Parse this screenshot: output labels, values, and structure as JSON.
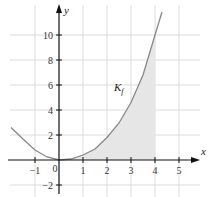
{
  "figure": {
    "x_axis_label": "x",
    "y_axis_label": "y",
    "curve_label": "K",
    "curve_label_sub": "f",
    "x_ticks": [
      "−1",
      "0",
      "1",
      "2",
      "3",
      "4",
      "5"
    ],
    "y_ticks": [
      "10",
      "8",
      "6",
      "4",
      "2",
      "−2"
    ],
    "shaded_interval": [
      0,
      4
    ],
    "colors": {
      "curve": "#888888",
      "shade": "#e4e4e4",
      "grid": "#d8d8d8",
      "axis": "#111111"
    }
  }
}
